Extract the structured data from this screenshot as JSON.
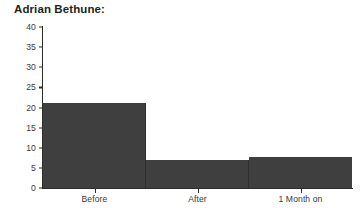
{
  "chart_data": {
    "type": "bar",
    "title": "Adrian Bethune:",
    "xlabel": "",
    "ylabel": "",
    "categories": [
      "Before",
      "After",
      "1 Month on"
    ],
    "values": [
      21,
      7,
      7.7
    ],
    "series": [
      {
        "name": "",
        "values": [
          21,
          7,
          7.7
        ]
      }
    ],
    "ylim": [
      0,
      40
    ],
    "ytick_labels": [
      "0",
      "5",
      "10",
      "15",
      "20",
      "25",
      "30",
      "35",
      "40"
    ],
    "ytick_values": [
      0,
      5,
      10,
      15,
      20,
      25,
      30,
      35,
      40
    ],
    "grid": false,
    "legend": false,
    "legend_position": "none",
    "bar_color": "#3f3f3f",
    "axis_color": "#2b2b2b",
    "background": "#ffffff"
  }
}
